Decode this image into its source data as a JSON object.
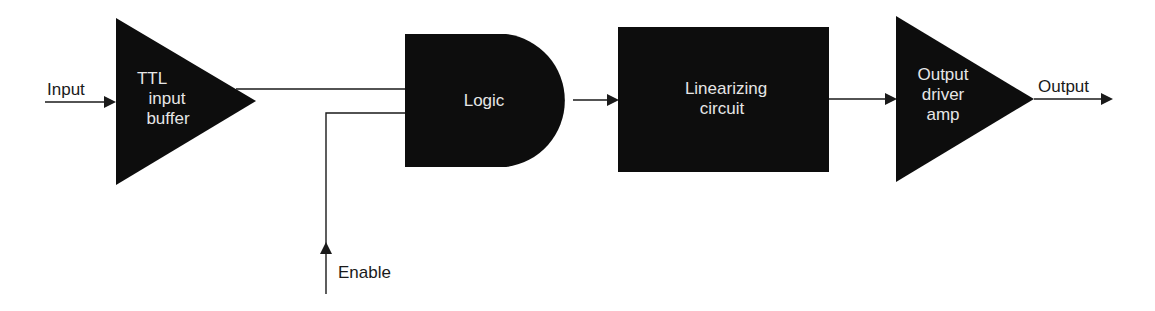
{
  "diagram": {
    "type": "block-diagram",
    "colors": {
      "block_fill": "#0d0d0d",
      "block_text": "#e6e6e6",
      "wire": "#1a1a1a",
      "background": "#ffffff"
    },
    "signals": {
      "input": "Input",
      "enable": "Enable",
      "output": "Output"
    },
    "blocks": [
      {
        "id": "ttl-buffer",
        "shape": "triangle",
        "lines": [
          "TTL",
          "input",
          "buffer"
        ]
      },
      {
        "id": "logic",
        "shape": "and-gate",
        "lines": [
          "Logic"
        ]
      },
      {
        "id": "linearizer",
        "shape": "rectangle",
        "lines": [
          "Linearizing",
          "circuit"
        ]
      },
      {
        "id": "output-amp",
        "shape": "triangle",
        "lines": [
          "Output",
          "driver",
          "amp"
        ]
      }
    ],
    "connections": [
      {
        "from": "Input",
        "to": "ttl-buffer"
      },
      {
        "from": "ttl-buffer",
        "to": "logic"
      },
      {
        "from": "Enable",
        "to": "logic"
      },
      {
        "from": "logic",
        "to": "linearizer"
      },
      {
        "from": "linearizer",
        "to": "output-amp"
      },
      {
        "from": "output-amp",
        "to": "Output"
      }
    ]
  }
}
